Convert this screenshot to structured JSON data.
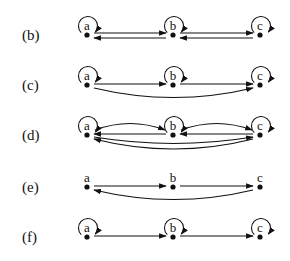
{
  "figure": {
    "nodes": [
      "a",
      "b",
      "c"
    ],
    "panels": [
      {
        "label": "(b)",
        "y": 35,
        "self_loops": [
          "a",
          "b",
          "c"
        ],
        "edges": [
          {
            "from": "a",
            "to": "b",
            "style": "straight-upper"
          },
          {
            "from": "b",
            "to": "a",
            "style": "straight-lower"
          },
          {
            "from": "b",
            "to": "c",
            "style": "straight-upper"
          },
          {
            "from": "c",
            "to": "b",
            "style": "straight-lower"
          }
        ]
      },
      {
        "label": "(c)",
        "y": 85,
        "self_loops": [
          "a",
          "b",
          "c"
        ],
        "edges": [
          {
            "from": "a",
            "to": "b",
            "style": "straight"
          },
          {
            "from": "b",
            "to": "c",
            "style": "straight"
          },
          {
            "from": "a",
            "to": "c",
            "style": "curve-below"
          }
        ]
      },
      {
        "label": "(d)",
        "y": 135,
        "self_loops": [
          "a",
          "b",
          "c"
        ],
        "edges": [
          {
            "from": "a",
            "to": "b",
            "style": "curve-above"
          },
          {
            "from": "b",
            "to": "a",
            "style": "straight"
          },
          {
            "from": "b",
            "to": "c",
            "style": "curve-above"
          },
          {
            "from": "c",
            "to": "b",
            "style": "straight"
          },
          {
            "from": "a",
            "to": "c",
            "style": "curve-below-inner"
          },
          {
            "from": "c",
            "to": "a",
            "style": "curve-below-outer"
          }
        ]
      },
      {
        "label": "(e)",
        "y": 187,
        "self_loops": [],
        "edges": [
          {
            "from": "a",
            "to": "b",
            "style": "straight"
          },
          {
            "from": "b",
            "to": "c",
            "style": "straight"
          },
          {
            "from": "c",
            "to": "a",
            "style": "curve-below"
          }
        ]
      },
      {
        "label": "(f)",
        "y": 237,
        "self_loops": [
          "a",
          "b",
          "c"
        ],
        "edges": [
          {
            "from": "a",
            "to": "b",
            "style": "straight"
          },
          {
            "from": "b",
            "to": "c",
            "style": "straight"
          }
        ]
      }
    ]
  }
}
